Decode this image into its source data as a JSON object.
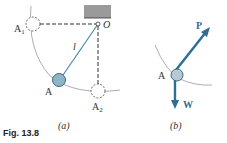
{
  "figure": {
    "caption": "Fig. 13.8",
    "panel_a": {
      "label": "(a)",
      "points": {
        "A1": "A",
        "A1_sub": "1",
        "O": "O",
        "A": "A",
        "A2": "A",
        "A2_sub": "2"
      },
      "length_label": "l"
    },
    "panel_b": {
      "label": "(b)",
      "point": "A",
      "force_p": "P",
      "force_w": "W"
    },
    "colors": {
      "accent": "#2e6e94",
      "bob": "#8fb3c9",
      "support": "#9a9a9a"
    }
  }
}
